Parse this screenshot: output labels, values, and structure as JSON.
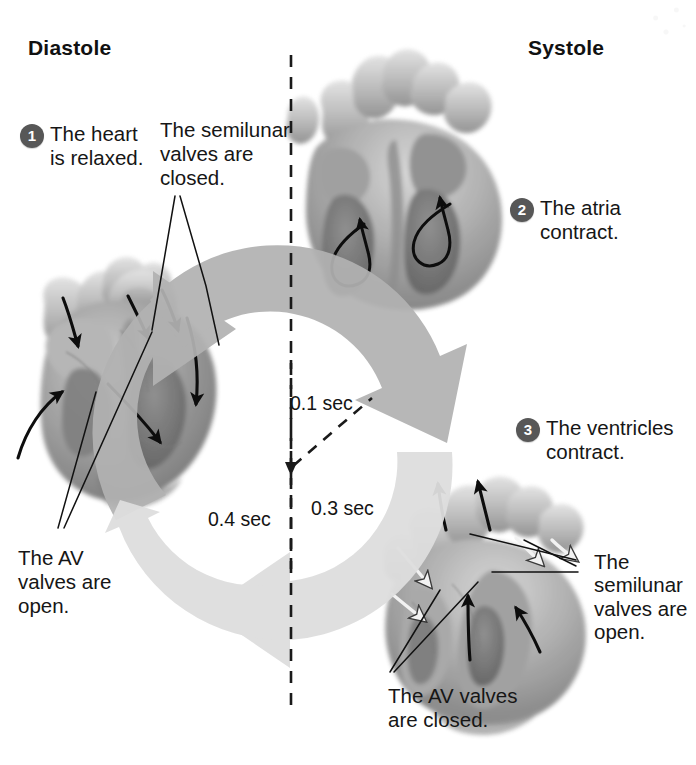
{
  "diagram": {
    "headings": {
      "left": "Diastole",
      "right": "Systole"
    },
    "steps": [
      {
        "number": "1",
        "text": "The heart\nis relaxed."
      },
      {
        "number": "2",
        "text": "The atria\ncontract."
      },
      {
        "number": "3",
        "text": "The ventricles\ncontract."
      }
    ],
    "callouts": [
      {
        "id": "semilunar-closed",
        "text": "The semilunar\nvalves are\nclosed."
      },
      {
        "id": "av-open",
        "text": "The AV\nvalves are\nopen."
      },
      {
        "id": "semilunar-open",
        "text": "The\nsemilunar\nvalves are\n open."
      },
      {
        "id": "av-closed",
        "text": "The AV valves\nare closed."
      }
    ],
    "timings": [
      {
        "id": "t-0-1",
        "label": "0.1 sec",
        "phase": "atrial-contraction"
      },
      {
        "id": "t-0-3",
        "label": "0.3 sec",
        "phase": "ventricular-contraction"
      },
      {
        "id": "t-0-4",
        "label": "0.4 sec",
        "phase": "relaxation"
      }
    ],
    "colors": {
      "arrow_upper": "#b2b2b2",
      "arrow_lower": "#dedede",
      "badge": "#575757",
      "text": "#161616",
      "heart_mid": "#9a9a9a",
      "heart_dark": "#6d6d6d",
      "heart_light": "#cfcfcf",
      "background": "#ffffff"
    },
    "figures": [
      {
        "id": "heart-diastole",
        "caption": "Relaxed heart, left side"
      },
      {
        "id": "heart-atrial-contraction",
        "caption": "Atria contracting, top"
      },
      {
        "id": "heart-ventricular-contraction",
        "caption": "Ventricles contracting, lower right"
      }
    ],
    "divider": {
      "id": "diastole-systole-divider",
      "style": "dashed-vertical"
    }
  }
}
